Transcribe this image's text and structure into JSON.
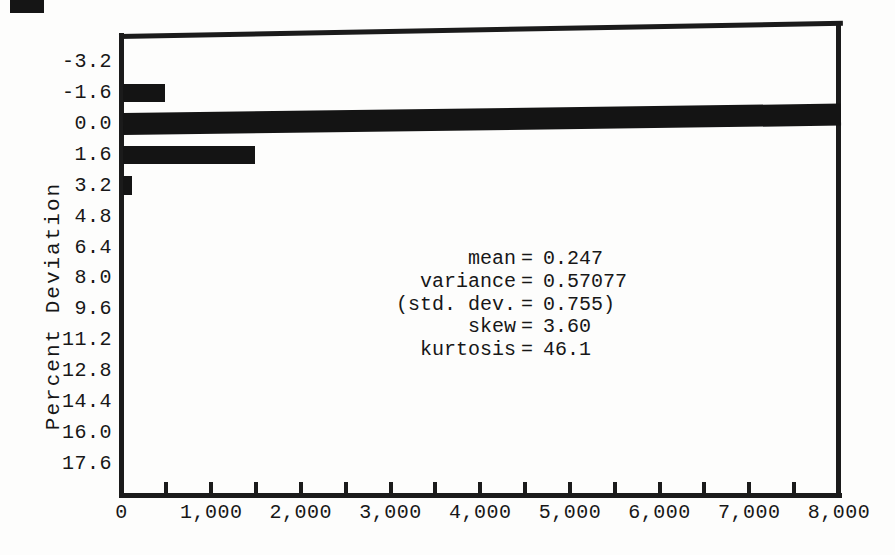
{
  "figure": {
    "background": "#fdfdfc",
    "ink": "#171717",
    "bar_color": "#141414"
  },
  "chart_data": {
    "type": "bar",
    "orientation": "horizontal",
    "title": "",
    "xlabel": "",
    "ylabel": "Percent Deviation",
    "categories": [
      "-3.2",
      "-1.6",
      "0.0",
      "1.6",
      "3.2",
      "4.8",
      "6.4",
      "8.0",
      "9.6",
      "11.2",
      "12.8",
      "14.4",
      "16.0",
      "17.6"
    ],
    "values": [
      0,
      470,
      8000,
      1470,
      100,
      0,
      0,
      0,
      0,
      0,
      0,
      0,
      0,
      0
    ],
    "bin_width": 1.6,
    "xlim": [
      0,
      8000
    ],
    "xticks": [
      0,
      1000,
      2000,
      3000,
      4000,
      5000,
      6000,
      7000,
      8000
    ],
    "xtick_labels": [
      "0",
      "1,000",
      "2,000",
      "3,000",
      "4,000",
      "5,000",
      "6,000",
      "7,000",
      "8,000"
    ],
    "xtick_step_minor": 500,
    "clipped_category": "0.0",
    "grid": "off",
    "equals_sign": "=",
    "annotations": [
      {
        "label": "mean",
        "value": "0.247"
      },
      {
        "label": "variance",
        "value": "0.57077"
      },
      {
        "label": "(std. dev.",
        "value": "0.755)"
      },
      {
        "label": "skew",
        "value": "3.60"
      },
      {
        "label": "kurtosis",
        "value": "46.1"
      }
    ]
  }
}
